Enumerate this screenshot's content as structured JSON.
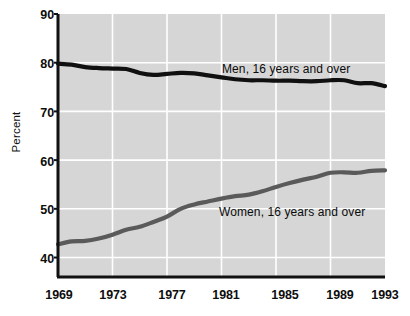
{
  "chart_data": {
    "type": "line",
    "title": "",
    "subtitle": "",
    "xlabel": "",
    "ylabel": "Percent",
    "xlim": [
      1969,
      1993
    ],
    "ylim": [
      36,
      90
    ],
    "yticks": [
      40,
      50,
      60,
      70,
      80,
      90
    ],
    "xticks": [
      1969,
      1973,
      1977,
      1981,
      1985,
      1989,
      1993
    ],
    "grid": "white gridlines on light gray plot background, horizontal and vertical",
    "legend_position": "inline labels next to each series",
    "plot_background": "#d6d6d6",
    "gridline_color": "#ffffff",
    "x": [
      1969,
      1970,
      1971,
      1972,
      1973,
      1974,
      1975,
      1976,
      1977,
      1978,
      1979,
      1980,
      1981,
      1982,
      1983,
      1984,
      1985,
      1986,
      1987,
      1988,
      1989,
      1990,
      1991,
      1992,
      1993
    ],
    "series": [
      {
        "name": "Men, 16 years and over",
        "label": "Men, 16 years and over",
        "color": "#101010",
        "line_width": 4.2,
        "values": [
          79.8,
          79.6,
          79.1,
          78.9,
          78.8,
          78.7,
          77.9,
          77.5,
          77.7,
          77.9,
          77.8,
          77.4,
          77.0,
          76.6,
          76.4,
          76.4,
          76.3,
          76.3,
          76.2,
          76.2,
          76.4,
          76.4,
          75.8,
          75.8,
          75.2
        ]
      },
      {
        "name": "Women, 16 years and over",
        "label": "Women, 16 years and over",
        "color": "#5a5a5a",
        "line_width": 4.2,
        "values": [
          42.7,
          43.3,
          43.4,
          43.9,
          44.7,
          45.7,
          46.3,
          47.3,
          48.4,
          50.0,
          50.9,
          51.5,
          52.1,
          52.6,
          52.9,
          53.6,
          54.5,
          55.3,
          56.0,
          56.6,
          57.4,
          57.5,
          57.4,
          57.8,
          57.9
        ]
      }
    ],
    "annotations": [
      {
        "text": "Men, 16 years and over",
        "x": 1980.3,
        "y": 79.0
      },
      {
        "text": "Women, 16 years and over",
        "x": 1980.2,
        "y": 50.5
      }
    ]
  },
  "axes": {
    "y_tick_labels": [
      "90",
      "80",
      "70",
      "60",
      "50",
      "40"
    ],
    "x_tick_labels": [
      "1969",
      "1973",
      "1977",
      "1981",
      "1985",
      "1989",
      "1993"
    ],
    "y_axis_title": "Percent"
  }
}
